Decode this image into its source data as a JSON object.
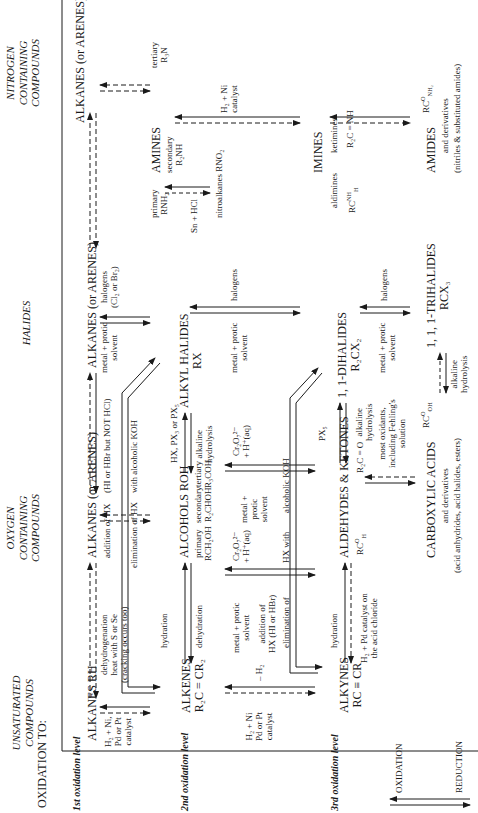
{
  "page_number": "000",
  "row_label": "OXIDATION TO:",
  "columns": [
    {
      "id": "unsaturated",
      "label_lines": [
        "UNSATURATED",
        "COMPOUNDS"
      ]
    },
    {
      "id": "oxygen",
      "label_lines": [
        "OXYGEN",
        "CONTAINING",
        "COMPOUNDS"
      ]
    },
    {
      "id": "halides",
      "label_lines": [
        "HALIDES"
      ]
    },
    {
      "id": "nitrogen",
      "label_lines": [
        "NITROGEN",
        "CONTAINING",
        "COMPOUNDS"
      ]
    }
  ],
  "levels": [
    {
      "label": "1st oxidation level"
    },
    {
      "label": "2nd oxidation level"
    },
    {
      "label": "3rd oxidation level"
    }
  ],
  "compounds": {
    "alkanes_rh": "ALKANES RH",
    "alkanes_arenes_oxy": "ALKANES (or ARENES)",
    "alkanes_arenes_hal": "ALKANES (or ARENES)",
    "alkanes_arenes_nit": "ALKANES (or ARENES)",
    "alkenes": "ALKENES",
    "alkenes_formula": "R₂C = CR₂",
    "alcohols": "ALCOHOLS ROH",
    "alcohols_primary": "primary",
    "alcohols_primary_formula": "RCH₂OH",
    "alcohols_secondary": "secondary",
    "alcohols_secondary_formula": "R₂CHOH",
    "alcohols_tertiary": "tertiary",
    "alcohols_tertiary_formula": "R₃COH",
    "alkyl_halides": "ALKYL HALIDES",
    "alkyl_halides_formula": "RX",
    "amines": "AMINES",
    "amines_primary": "primary",
    "amines_primary_formula": "RNH₂",
    "amines_secondary": "secondary",
    "amines_secondary_formula": "R₂NH",
    "amines_tertiary": "tertiary",
    "amines_tertiary_formula": "R₃N",
    "nitroalkanes": "nitroalkanes RNO₂",
    "alkynes": "ALKYNES",
    "alkynes_formula": "RC ≡ CR",
    "aldehydes_ketones": "ALDEHYDES & KETONES",
    "aldehyde_formula_top": "RC",
    "aldehyde_formula_o": "O",
    "aldehyde_formula_h": "H",
    "ketone_formula": "R₂C = O",
    "dihalides": "1, 1-DIHALIDES",
    "dihalides_formula": "R₂CX₂",
    "imines": "IMINES",
    "imines_aldimines": "aldimines",
    "imines_ketimines": "ketimines",
    "aldimine_formula_top": "RC",
    "aldimine_formula_nh": "NH",
    "aldimine_formula_h": "H",
    "ketimine_formula": "R₂C = NH",
    "carboxylic_acids": "CARBOXYLIC ACIDS",
    "carboxylic_formula_rc": "RC",
    "carboxylic_formula_o": "O",
    "carboxylic_formula_oh": "OH",
    "carboxylic_derivatives": "and derivatives",
    "carboxylic_examples": "(acid anhydrides, acid halides, esters)",
    "trihalides": "1, 1, 1-TRIHALIDES",
    "trihalides_formula": "RCX₃",
    "amides": "AMIDES",
    "amides_formula_rc": "RC",
    "amides_formula_o": "O",
    "amides_formula_nh2": "NH₂",
    "amides_derivatives": "and derivatives",
    "amides_examples": "(nitriles & substituted amides)"
  },
  "reagents": {
    "h2_ni_pd_pt_1": [
      "H₂ + Ni,",
      "Pd or Pt",
      "catalyst"
    ],
    "dehydrogenation": [
      "dehydrogenation",
      "heat with S or Se",
      "(cracking occurs too)"
    ],
    "addition_hx": "addition of HX",
    "hi_hbr_not_hcl": "(HI or HBr but NOT HCl)",
    "elimination_hx": "elimination of HX",
    "with_alcoholic_koh": "with alcoholic KOH",
    "metal_protic_1": [
      "metal + protic",
      "solvent"
    ],
    "halogens_cl2_br2": [
      "halogens",
      "(Cl₂ or Br₂)"
    ],
    "sn_hcl": "Sn + HCl",
    "h2_ni_catalyst_imine": [
      "H₂ + Ni",
      "catalyst"
    ],
    "hydration_1": "hydration",
    "dehydration": "dehydration",
    "hx_px3_px5": "HX, PX₃ or PX₅",
    "alkaline_hydrolysis_1": [
      "alkaline",
      "hydrolysis"
    ],
    "halogens_2": "halogens",
    "metal_protic_2": [
      "metal + protic",
      "solvent"
    ],
    "h2_ni_pd_pt_2": [
      "H₂ + Ni",
      "Pd or Pt",
      "catalyst"
    ],
    "minus_h2": "– H₂",
    "metal_protic_3": [
      "metal + protic",
      "solvent"
    ],
    "addition_hx_2": [
      "addition of",
      "HX (HI or HBr)"
    ],
    "elimination_of": "elimination of",
    "hx_with": "HX with",
    "alcoholic_koh": "alcoholic KOH",
    "cr2o7_1": [
      "Cr₂O₇²⁻",
      "+ H⁺(aq)"
    ],
    "metal_protic_small": [
      "metal +",
      "protic",
      "solvent"
    ],
    "cr2o7_2": [
      "Cr₂O₇²⁻",
      "+ H⁺(aq)"
    ],
    "px5": "PX₅",
    "alkaline_hydrolysis_2": [
      "alkaline",
      "hydrolysis"
    ],
    "halogens_3": "halogens",
    "metal_protic_4": [
      "metal + protic",
      "solvent"
    ],
    "hydration_2": "hydration",
    "h2_pd_acid_chloride": [
      "H₂ + Pd catalyst on",
      "the acid chloride"
    ],
    "most_oxidants": [
      "most oxidants,",
      "including Fehling's",
      "solution"
    ],
    "alkaline_hydrolysis_3": [
      "alkaline",
      "hydrolysis"
    ]
  },
  "legend": {
    "oxidation": "OXIDATION",
    "reduction": "REDUCTION"
  }
}
